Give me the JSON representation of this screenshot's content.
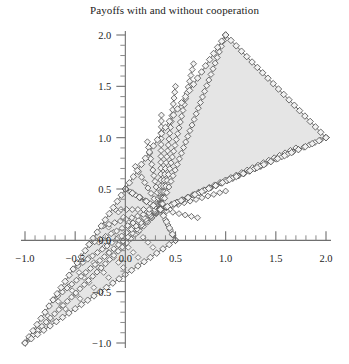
{
  "chart_data": {
    "type": "scatter",
    "title": "Payoffs with and without cooperation",
    "xlabel": "",
    "ylabel": "",
    "xlim": [
      -1.15,
      2.15
    ],
    "ylim": [
      -1.12,
      2.12
    ],
    "xticks": [
      -1.0,
      -0.5,
      0.0,
      0.5,
      1.0,
      1.5,
      2.0
    ],
    "xtick_labels": [
      "-1.0",
      "-0.5",
      "0.0",
      "0.5",
      "1.0",
      "1.5",
      "2.0"
    ],
    "yticks": [
      -1.0,
      -0.5,
      0.0,
      0.5,
      1.0,
      1.5,
      2.0
    ],
    "ytick_labels": [
      "-1.0",
      "-0.5",
      "0.0",
      "0.5",
      "1.0",
      "1.5",
      "2.0"
    ],
    "minor_tick_step": 0.1,
    "grid": false,
    "legend": null,
    "axis_style": "crossed-spines-at-origin",
    "marker_style": "open-diamond",
    "region_fill_color": "#e3e3e3",
    "region_edge_color": "#5c5c5c",
    "series": [
      {
        "name": "cooperative payoff region",
        "type": "polygon",
        "vertices": [
          [
            1.0,
            2.0
          ],
          [
            2.0,
            1.0
          ],
          [
            0.35,
            0.3
          ],
          [
            0.0,
            0.5
          ]
        ],
        "boundary_markers": true
      },
      {
        "name": "non-cooperative payoff wedge",
        "type": "polygon",
        "vertices": [
          [
            -1.0,
            -1.0
          ],
          [
            0.0,
            0.5
          ],
          [
            0.35,
            0.3
          ],
          [
            0.5,
            0.0
          ]
        ],
        "boundary_markers": true
      },
      {
        "name": "fan of iso-payoff chords",
        "type": "lines",
        "apex": [
          0.35,
          0.3
        ],
        "endpoints": [
          [
            -1.0,
            -1.0
          ],
          [
            -0.72,
            -0.58
          ],
          [
            -0.52,
            -0.28
          ],
          [
            -0.36,
            -0.04
          ],
          [
            -0.22,
            0.14
          ],
          [
            -0.1,
            0.3
          ],
          [
            0.0,
            0.5
          ],
          [
            0.1,
            0.72
          ],
          [
            0.22,
            0.96
          ],
          [
            0.36,
            1.22
          ],
          [
            0.5,
            1.5
          ],
          [
            0.68,
            1.72
          ],
          [
            1.0,
            2.0
          ],
          [
            0.5,
            0.0
          ],
          [
            0.72,
            0.22
          ],
          [
            1.0,
            0.48
          ],
          [
            1.35,
            0.72
          ],
          [
            1.7,
            0.9
          ],
          [
            2.0,
            1.0
          ]
        ]
      },
      {
        "name": "interior lattice of payoff points",
        "type": "scatter-lattice",
        "rows": 9,
        "region": "non-cooperative wedge interior"
      }
    ],
    "notable_points": [
      {
        "label": "apex",
        "x": 1.0,
        "y": 2.0
      },
      {
        "label": "right vertex",
        "x": 2.0,
        "y": 1.0
      },
      {
        "label": "kink",
        "x": 0.35,
        "y": 0.3
      },
      {
        "label": "upper-left vertex",
        "x": 0.0,
        "y": 0.5
      },
      {
        "label": "lower vertex",
        "x": -1.0,
        "y": -1.0
      },
      {
        "label": "lower-right vertex",
        "x": 0.5,
        "y": 0.0
      }
    ]
  }
}
